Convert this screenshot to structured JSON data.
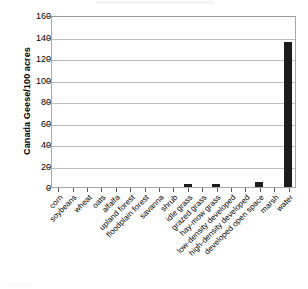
{
  "chart_data": {
    "type": "bar",
    "title": "",
    "subtitle": "",
    "xlabel": "",
    "ylabel": "Canada Geese/100 acres",
    "ylim": [
      0,
      160
    ],
    "yticks": [
      0,
      20,
      40,
      60,
      80,
      100,
      120,
      140,
      160
    ],
    "ytick_labels": [
      "0",
      "20",
      "40",
      "60",
      "80",
      "100",
      "120",
      "140",
      "160"
    ],
    "grid": "horizontal",
    "legend": "none",
    "bar_color": "#1c1c1c",
    "gridline_color": "#bdbdbd",
    "axis_color": "#a8a8a8",
    "categories": [
      "corn",
      "soybeans",
      "wheat",
      "oats",
      "alfalfa",
      "upland forest",
      "floodplain forest",
      "savanna",
      "shrub",
      "idle grass",
      "grazed grass",
      "hay-mow grass",
      "low-density developed",
      "high-density developed",
      "developed open space",
      "marsh",
      "water"
    ],
    "values": [
      0,
      0,
      0,
      0,
      0,
      0,
      0,
      0,
      0,
      2.5,
      0,
      2.5,
      0,
      0,
      4.5,
      0,
      134.5
    ]
  }
}
